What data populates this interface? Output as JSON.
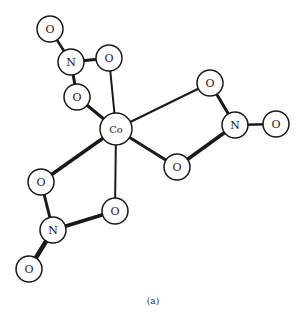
{
  "diagram": {
    "caption": "(a)",
    "center_atom": {
      "label": "Co",
      "x": 116,
      "y": 129,
      "r": 16
    },
    "atoms": [
      {
        "id": "o1",
        "label": "O",
        "x": 50,
        "y": 29,
        "r": 13
      },
      {
        "id": "n1",
        "label": "N",
        "x": 71,
        "y": 62,
        "r": 13
      },
      {
        "id": "o2",
        "label": "O",
        "x": 109,
        "y": 58,
        "r": 13
      },
      {
        "id": "o3",
        "label": "O",
        "x": 77,
        "y": 97,
        "r": 13
      },
      {
        "id": "o4",
        "label": "O",
        "x": 210,
        "y": 83,
        "r": 13
      },
      {
        "id": "n2",
        "label": "N",
        "x": 235,
        "y": 125,
        "r": 13
      },
      {
        "id": "o5",
        "label": "O",
        "x": 276,
        "y": 124,
        "r": 13
      },
      {
        "id": "o6",
        "label": "O",
        "x": 177,
        "y": 167,
        "r": 13
      },
      {
        "id": "o7",
        "label": "O",
        "x": 41,
        "y": 182,
        "r": 13
      },
      {
        "id": "o8",
        "label": "O",
        "x": 115,
        "y": 211,
        "r": 13
      },
      {
        "id": "n3",
        "label": "N",
        "x": 53,
        "y": 230,
        "r": 13
      },
      {
        "id": "o9",
        "label": "O",
        "x": 29,
        "y": 269,
        "r": 13
      }
    ]
  }
}
